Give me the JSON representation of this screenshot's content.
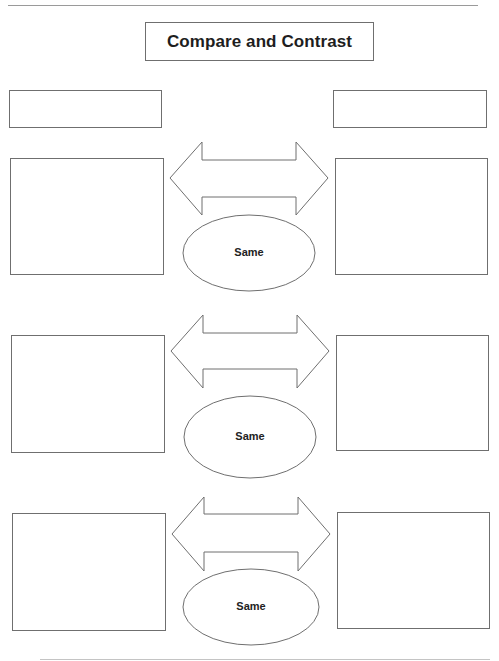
{
  "page": {
    "title": "Compare and Contrast",
    "colors": {
      "stroke": "#6f6f6f",
      "text": "#1e1e1e",
      "background": "#ffffff"
    }
  },
  "organizer": {
    "label_boxes": [
      {
        "side": "left",
        "text": ""
      },
      {
        "side": "right",
        "text": ""
      }
    ],
    "rows": [
      {
        "left_box": "",
        "right_box": "",
        "center_label": "Same",
        "connector": "double-arrow"
      },
      {
        "left_box": "",
        "right_box": "",
        "center_label": "Same",
        "connector": "double-arrow"
      },
      {
        "left_box": "",
        "right_box": "",
        "center_label": "Same",
        "connector": "double-arrow"
      }
    ]
  }
}
